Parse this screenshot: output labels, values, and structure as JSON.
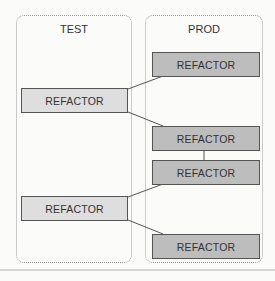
{
  "lanes": {
    "test": {
      "title": "TEST"
    },
    "prod": {
      "title": "PROD"
    }
  },
  "boxes": {
    "prod1": {
      "label": "REFACTOR"
    },
    "test1": {
      "label": "REFACTOR"
    },
    "prod2": {
      "label": "REFACTOR"
    },
    "prod3": {
      "label": "REFACTOR"
    },
    "test2": {
      "label": "REFACTOR"
    },
    "prod4": {
      "label": "REFACTOR"
    }
  },
  "colors": {
    "test_box_fill": "#dedede",
    "prod_box_fill": "#bdbdbd",
    "border": "#555555",
    "lane_border": "#9a9a9a"
  }
}
